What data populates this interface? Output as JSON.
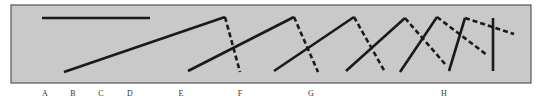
{
  "figure": {
    "panel": {
      "x": 11,
      "y": 5,
      "width": 520,
      "height": 78,
      "fill": "#c9c9c9",
      "stroke": "#555555"
    },
    "stroke_color": "#1a1a1a",
    "solid_width": 2.6,
    "dashed_width": 2.6,
    "dash_pattern": "5,3",
    "reference_line": {
      "x1": 42,
      "y1": 18,
      "x2": 150,
      "y2": 18
    },
    "segments": [
      {
        "id": "E",
        "solid": {
          "x1": 64,
          "y1": 72,
          "x2": 225,
          "y2": 17
        },
        "dashed": {
          "x1": 225,
          "y1": 17,
          "x2": 240,
          "y2": 72
        }
      },
      {
        "id": "F",
        "solid": {
          "x1": 188,
          "y1": 71,
          "x2": 294,
          "y2": 17
        },
        "dashed": {
          "x1": 294,
          "y1": 17,
          "x2": 318,
          "y2": 72
        }
      },
      {
        "id": "G1",
        "solid": {
          "x1": 274,
          "y1": 71,
          "x2": 354,
          "y2": 17
        },
        "dashed": {
          "x1": 354,
          "y1": 17,
          "x2": 385,
          "y2": 72
        }
      },
      {
        "id": "G2",
        "solid": {
          "x1": 346,
          "y1": 71,
          "x2": 405,
          "y2": 18
        },
        "dashed": {
          "x1": 405,
          "y1": 18,
          "x2": 445,
          "y2": 64
        }
      },
      {
        "id": "H1",
        "solid": {
          "x1": 400,
          "y1": 72,
          "x2": 437,
          "y2": 17
        },
        "dashed": {
          "x1": 437,
          "y1": 17,
          "x2": 487,
          "y2": 55
        }
      },
      {
        "id": "H2",
        "solid": {
          "x1": 449,
          "y1": 71,
          "x2": 465,
          "y2": 18
        },
        "dashed": {
          "x1": 465,
          "y1": 18,
          "x2": 514,
          "y2": 34
        }
      },
      {
        "id": "H3",
        "solid": {
          "x1": 493,
          "y1": 18,
          "x2": 493,
          "y2": 71
        },
        "dashed": null
      }
    ],
    "labels": [
      {
        "text": "A",
        "x": 45
      },
      {
        "text": "B",
        "x": 73
      },
      {
        "text": "C",
        "x": 101
      },
      {
        "text": "D",
        "x": 130
      },
      {
        "text": "E",
        "x": 181
      },
      {
        "text": "F",
        "x": 240
      },
      {
        "text": "G",
        "x": 311
      },
      {
        "text": "H",
        "x": 444
      }
    ]
  }
}
